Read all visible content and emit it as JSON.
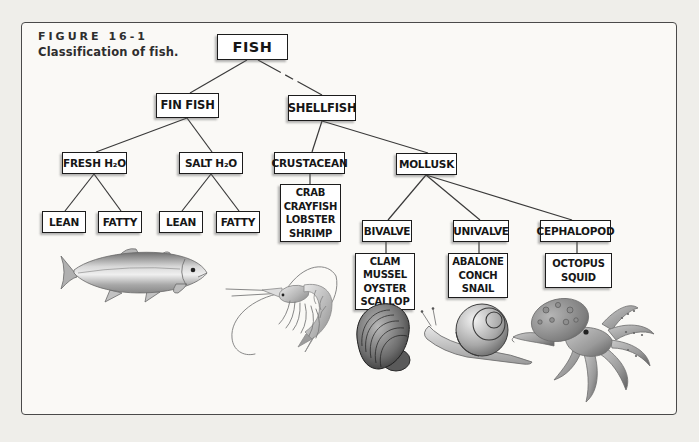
{
  "figure": {
    "label": "FIGURE 16-1",
    "caption": "Classification of fish."
  },
  "tree": {
    "fish": "FISH",
    "fin_fish": "FIN FISH",
    "shellfish": "SHELLFISH",
    "fresh_h2o": "FRESH H₂O",
    "salt_h2o": "SALT H₂O",
    "crustacean": "CRUSTACEAN",
    "mollusk": "MOLLUSK",
    "fresh_lean": "LEAN",
    "fresh_fatty": "FATTY",
    "salt_lean": "LEAN",
    "salt_fatty": "FATTY",
    "crustacean_examples": [
      "CRAB",
      "CRAYFISH",
      "LOBSTER",
      "SHRIMP"
    ],
    "bivalve": "BIVALVE",
    "univalve": "UNIVALVE",
    "cephalopod": "CEPHALOPOD",
    "bivalve_examples": [
      "CLAM",
      "MUSSEL",
      "OYSTER",
      "SCALLOP"
    ],
    "univalve_examples": [
      "ABALONE",
      "CONCH",
      "SNAIL"
    ],
    "cephalopod_examples": [
      "OCTOPUS",
      "SQUID"
    ]
  },
  "illustrations": [
    "freshwater fin fish (trout)",
    "shrimp (crustacean)",
    "mussel (bivalve)",
    "snail (univalve)",
    "octopus (cephalopod)"
  ],
  "colors": {
    "background": "#efeeea",
    "panel": "#faf9f6",
    "box_fill": "#ffffff",
    "box_border": "#1c1c1c",
    "connector": "#3a3a3a",
    "text": "#161616"
  }
}
